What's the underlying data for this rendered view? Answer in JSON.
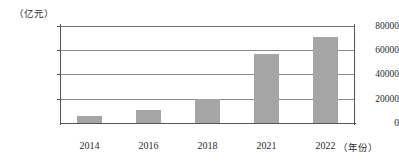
{
  "chart_data": {
    "type": "bar",
    "title": "",
    "subtitle": "",
    "xlabel": "（年份）",
    "ylabel": "（亿元）",
    "categories": [
      "2014",
      "2016",
      "2018",
      "2021",
      "2022"
    ],
    "values": [
      6000,
      10500,
      20000,
      57000,
      71000
    ],
    "series": [
      {
        "name": "",
        "values": [
          6000,
          10500,
          20000,
          57000,
          71000
        ]
      }
    ],
    "ylim": [
      0,
      80000
    ],
    "yticks": [
      "0",
      "20000",
      "40000",
      "60000",
      "80000"
    ],
    "ytick_values": [
      0,
      20000,
      40000,
      60000,
      80000
    ],
    "grid": true,
    "grid_axis": "y",
    "legend": false,
    "legend_position": "none",
    "bar_color": "#a5a5a5",
    "axis_color": "#555555",
    "gridline_color": "#8a8a8a"
  },
  "axes": {
    "y_unit_caption": "（亿元）",
    "x_unit_caption": "（年份）"
  }
}
